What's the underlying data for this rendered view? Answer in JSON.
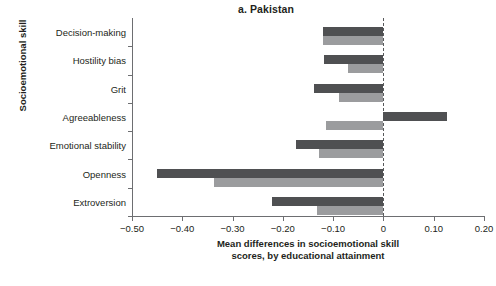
{
  "chart_data": {
    "type": "bar",
    "orientation": "horizontal",
    "title": "a. Pakistan",
    "xlabel_line1": "Mean differences in socioemotional skill",
    "xlabel_line2": "scores, by educational attainment",
    "ylabel": "Socioemotional skill",
    "categories": [
      "Decision-making",
      "Hostility bias",
      "Grit",
      "Agreeableness",
      "Emotional stability",
      "Openness",
      "Extroversion"
    ],
    "series": [
      {
        "name": "dark",
        "color": "#4f5052",
        "values": [
          -0.121,
          -0.119,
          -0.139,
          0.127,
          -0.173,
          -0.451,
          -0.221
        ]
      },
      {
        "name": "light",
        "color": "#9b9c9e",
        "values": [
          -0.121,
          -0.07,
          -0.089,
          -0.115,
          -0.129,
          -0.336,
          -0.133
        ]
      }
    ],
    "xlim": [
      -0.5,
      0.2
    ],
    "xticks": [
      -0.5,
      -0.4,
      -0.3,
      -0.2,
      -0.1,
      0,
      0.1,
      0.2
    ],
    "xtick_labels": [
      "−0.50",
      "−0.40",
      "−0.30",
      "−0.20",
      "−0.10",
      "0",
      "0.10",
      "0.20"
    ],
    "zero_line": 0,
    "grid": false,
    "legend": "none"
  },
  "footer": {
    "sliver_text": " "
  }
}
